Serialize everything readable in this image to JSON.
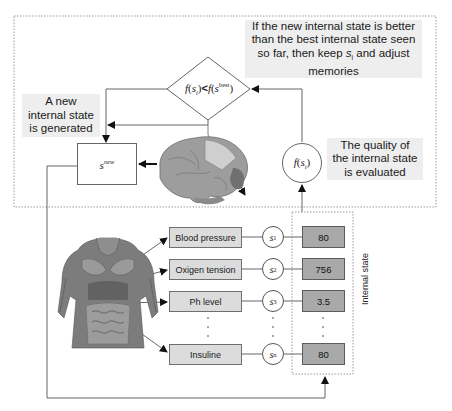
{
  "diagram": {
    "notes": {
      "top_right": {
        "line1": "If the new internal state is better",
        "line2": "than the best internal state seen",
        "line3_pre": "so far, then keep ",
        "line3_var": "s",
        "line3_sub": "i",
        "line3_post": " and adjust",
        "line4": "memories"
      },
      "left": {
        "line1": "A new",
        "line2": "internal state",
        "line3": "is generated"
      },
      "right": {
        "line1": "The quality of",
        "line2": "the internal state",
        "line3": "is evaluated"
      }
    },
    "decision": {
      "lhs_f": "f",
      "lhs_var": "s",
      "lhs_sub": "i",
      "operator": "<",
      "rhs_f": "f",
      "rhs_var": "s",
      "rhs_sup": "best"
    },
    "new_state": {
      "var": "s",
      "sup": "new"
    },
    "evaluation": {
      "f": "f",
      "var": "s",
      "sub": "i"
    },
    "internal_state_label": "Internal state",
    "rows": [
      {
        "label": "Blood pressure",
        "state_var": "s",
        "state_sub": "1",
        "value": "80"
      },
      {
        "label": "Oxigen tension",
        "state_var": "s",
        "state_sub": "2",
        "value": "756"
      },
      {
        "label": "Ph level",
        "state_var": "s",
        "state_sub": "3",
        "value": "3.5"
      },
      {
        "label": "Insuline",
        "state_var": "s",
        "state_sub": "n",
        "value": "80"
      }
    ],
    "ellipsis": "·",
    "images": {
      "brain": "brain-illustration",
      "torso": "human-torso-anatomy-illustration"
    },
    "colors": {
      "label_box_fill": "#dcdcdc",
      "value_box_fill": "#a9a9a9",
      "note_fill": "#eeeeee",
      "line": "#555555",
      "dotted_border": "#9a9a9a"
    }
  }
}
